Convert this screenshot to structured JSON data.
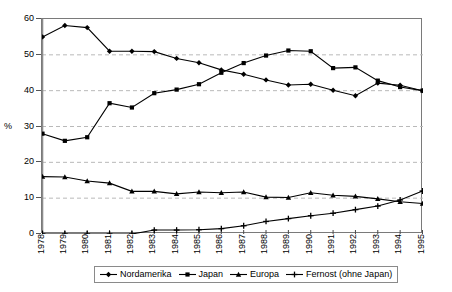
{
  "chart_data": {
    "type": "line",
    "title": "",
    "xlabel": "",
    "ylabel": "%",
    "ylim": [
      0,
      60
    ],
    "ytick_values": [
      0,
      10,
      20,
      30,
      40,
      50,
      60
    ],
    "ytick_labels": [
      "0",
      "10",
      "20",
      "30",
      "40",
      "50",
      "60"
    ],
    "grid": "horizontal-dashed",
    "legend_position": "bottom",
    "categories": [
      "1978",
      "1979",
      "1980",
      "1981",
      "1982",
      "1983",
      "1984",
      "1985",
      "1986",
      "1987",
      "1988",
      "1989",
      "1990",
      "1991",
      "1992",
      "1993",
      "1994",
      "1995"
    ],
    "series": [
      {
        "name": "Nordamerika",
        "marker": "diamond",
        "color": "#000000",
        "values": [
          55.0,
          58.2,
          57.6,
          51.0,
          51.0,
          50.9,
          49.0,
          47.8,
          45.8,
          44.6,
          43.0,
          41.6,
          41.8,
          40.1,
          38.6,
          42.1,
          41.5,
          40.0
        ]
      },
      {
        "name": "Japan",
        "marker": "square",
        "color": "#000000",
        "values": [
          28.0,
          26.0,
          27.0,
          36.5,
          35.3,
          39.3,
          40.3,
          41.8,
          45.0,
          47.7,
          49.8,
          51.2,
          51.0,
          46.3,
          46.5,
          42.8,
          41.0,
          40.0
        ]
      },
      {
        "name": "Europa",
        "marker": "triangle",
        "color": "#000000",
        "values": [
          16.0,
          15.9,
          14.8,
          14.2,
          11.9,
          11.9,
          11.2,
          11.7,
          11.5,
          11.7,
          10.3,
          10.2,
          11.5,
          10.8,
          10.5,
          9.8,
          9.0,
          8.5
        ]
      },
      {
        "name": "Fernost (ohne Japan)",
        "marker": "cross",
        "color": "#000000",
        "values": [
          0.0,
          0.0,
          0.0,
          0.0,
          0.0,
          1.1,
          1.1,
          1.2,
          1.5,
          2.3,
          3.5,
          4.3,
          5.1,
          5.8,
          6.8,
          7.8,
          9.5,
          12.0
        ]
      }
    ]
  },
  "axis": {
    "y_title": "%"
  }
}
